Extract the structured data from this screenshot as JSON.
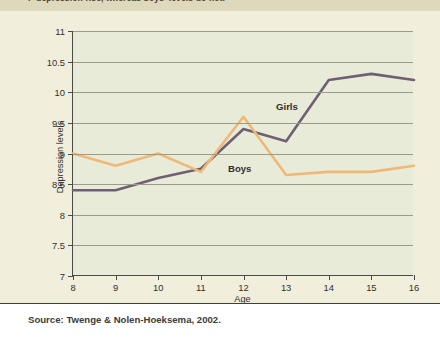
{
  "intro": {
    "text": "r' depression rise, whereas boys' levels do not."
  },
  "source": {
    "label": "Source: Twenge & Nolen-Hoeksema, 2002."
  },
  "series_tags": {
    "girls": "Girls",
    "boys": "Boys"
  },
  "colors": {
    "girls_line": "#6f5f73",
    "boys_line": "#eeb978",
    "plot_background": "#e9ebd9",
    "card_background": "#f1efdc",
    "intro_band": "#ded8bd",
    "gridline": "#9a9c8c",
    "axis": "#4a4a46",
    "text": "#2f2f2c"
  },
  "chart_data": {
    "type": "line",
    "title": "",
    "xlabel": "Age",
    "ylabel": "Depression levels",
    "x": [
      8,
      9,
      10,
      11,
      12,
      13,
      14,
      15,
      16
    ],
    "xticks": [
      "8",
      "9",
      "10",
      "11",
      "12",
      "13",
      "14",
      "15",
      "16"
    ],
    "yticks": [
      "7",
      "7.5",
      "8",
      "8.5",
      "9",
      "9.5",
      "10",
      "10.5",
      "11"
    ],
    "ytick_values": [
      7,
      7.5,
      8,
      8.5,
      9,
      9.5,
      10,
      10.5,
      11
    ],
    "xlim": [
      8,
      16
    ],
    "ylim": [
      7,
      11
    ],
    "grid": true,
    "legend": "inline-labels",
    "series": [
      {
        "name": "Girls",
        "color": "#6f5f73",
        "values": [
          8.4,
          8.4,
          8.6,
          8.75,
          9.4,
          9.2,
          10.2,
          10.3,
          10.2
        ]
      },
      {
        "name": "Boys",
        "color": "#eeb978",
        "values": [
          9.0,
          8.8,
          9.0,
          8.7,
          9.6,
          8.65,
          8.7,
          8.7,
          8.8
        ]
      }
    ]
  }
}
